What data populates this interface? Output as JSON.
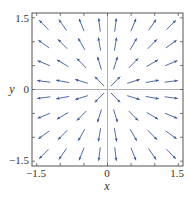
{
  "chart_data": {
    "type": "vector_field",
    "title": "",
    "xlabel": "x",
    "ylabel": "y",
    "xlim": [
      -1.6,
      1.6
    ],
    "ylim": [
      -1.6,
      1.6
    ],
    "x_ticks": [
      -1.5,
      -1.0,
      -0.5,
      0,
      0.5,
      1.0,
      1.5
    ],
    "y_ticks": [
      -1.5,
      -1.0,
      -0.5,
      0,
      0.5,
      1.0,
      1.5
    ],
    "x_tick_labels": [
      "-1.5",
      "0",
      "1.5"
    ],
    "y_tick_labels": [
      "1.5",
      "0",
      "-1.5"
    ],
    "x_tick_label_values": [
      -1.5,
      0,
      1.5
    ],
    "y_tick_label_values": [
      1.5,
      0,
      -1.5
    ],
    "grid": false,
    "axes_lines_through_origin": true,
    "field_description": "radial outward field F(x,y) = (x, y), arrows normalized",
    "sample_points": [
      -1.35,
      -0.95,
      -0.55,
      -0.17,
      0.17,
      0.55,
      0.95,
      1.35
    ],
    "arrow_length_units": 0.28,
    "colors": {
      "arrow": "#3c5a9a",
      "frame": "#555555",
      "axis_lines": "#9a9a9a",
      "text": "#333333"
    }
  },
  "labels": {
    "x_axis": "x",
    "y_axis": "y",
    "x_min": "−1.5",
    "x_zero": "0",
    "x_max": "1.5",
    "y_max": "1.5",
    "y_zero": "0",
    "y_min": "−1.5"
  }
}
